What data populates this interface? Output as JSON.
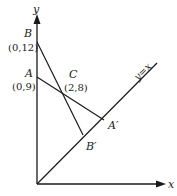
{
  "diagram": {
    "axes": {
      "x_label": "x",
      "y_label": "y"
    },
    "line_label": "y=x",
    "points": {
      "B": {
        "name": "B",
        "coords": "(0,12)"
      },
      "A": {
        "name": "A",
        "coords": "(0,9)"
      },
      "C": {
        "name": "C",
        "coords": "(2,8)"
      },
      "A_prime": {
        "name": "A′"
      },
      "B_prime": {
        "name": "B′"
      }
    },
    "colors": {
      "stroke": "#1a1a1a",
      "background": "#ffffff"
    }
  }
}
